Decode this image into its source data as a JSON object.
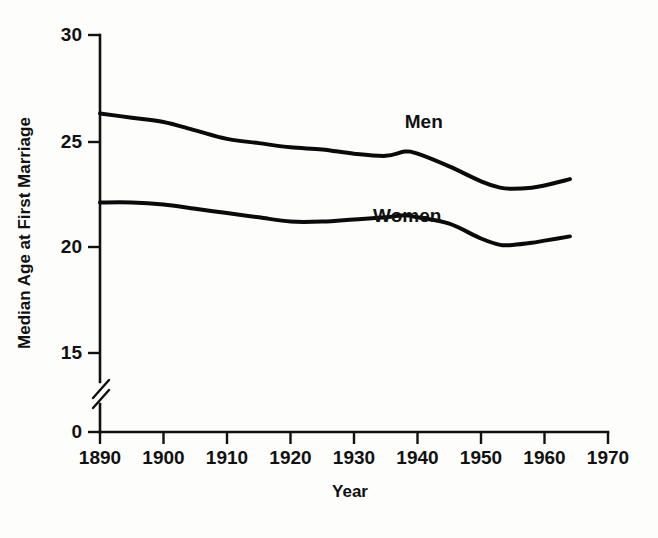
{
  "chart_data": {
    "type": "line",
    "title": "",
    "xlabel": "Year",
    "ylabel": "Median Age at First Marriage",
    "xlim": [
      1890,
      1970
    ],
    "ylim": [
      15,
      30
    ],
    "y_axis_break": true,
    "y_break_between": [
      0,
      15
    ],
    "grid": false,
    "legend_position": "inline-labels",
    "xticks": [
      1890,
      1900,
      1910,
      1920,
      1930,
      1940,
      1950,
      1960,
      1970
    ],
    "xtick_labels": [
      "1890",
      "1900",
      "1910",
      "1920",
      "1930",
      "1940",
      "1950",
      "1960",
      "1970"
    ],
    "yticks": [
      0,
      15,
      20,
      25,
      30
    ],
    "ytick_labels": [
      "0",
      "15",
      "20",
      "25",
      "30"
    ],
    "x": [
      1890,
      1895,
      1900,
      1905,
      1910,
      1915,
      1920,
      1925,
      1930,
      1935,
      1938,
      1940,
      1945,
      1950,
      1953,
      1955,
      1958,
      1960,
      1964
    ],
    "series": [
      {
        "name": "Men",
        "label": "Men",
        "color": "#0a0a0a",
        "label_x": 1938,
        "label_y": 25.6,
        "values": [
          26.3,
          26.1,
          25.9,
          25.5,
          25.1,
          24.9,
          24.7,
          24.6,
          24.4,
          24.3,
          24.5,
          24.4,
          23.8,
          23.1,
          22.8,
          22.75,
          22.8,
          22.9,
          23.2
        ]
      },
      {
        "name": "Women",
        "label": "Women",
        "color": "#0a0a0a",
        "label_x": 1933,
        "label_y": 21.2,
        "values": [
          22.1,
          22.1,
          22.0,
          21.8,
          21.6,
          21.4,
          21.2,
          21.2,
          21.3,
          21.4,
          21.5,
          21.4,
          21.1,
          20.4,
          20.1,
          20.1,
          20.2,
          20.3,
          20.5
        ]
      }
    ]
  },
  "figure": {
    "width": 658,
    "height": 538,
    "background": "#fdfdfc",
    "ink_color": "#111111"
  },
  "icons": {
    "axis_break": "axis-break-slash"
  }
}
